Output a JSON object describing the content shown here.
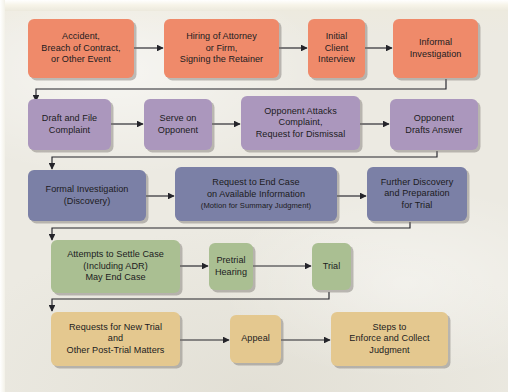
{
  "diagram": {
    "type": "flowchart",
    "background_color": "#eceae2",
    "rows": [
      {
        "id": "event-row",
        "name": "pre-litigation",
        "color": "#ef8a6a",
        "nodes": [
          {
            "id": "accident",
            "label": "Accident,\nBreach of Contract,\nor Other Event"
          },
          {
            "id": "hiring",
            "label": "Hiring of Attorney\nor Firm,\nSigning the Retainer"
          },
          {
            "id": "interview",
            "label": "Initial\nClient\nInterview"
          },
          {
            "id": "informal",
            "label": "Informal\nInvestigation"
          }
        ]
      },
      {
        "id": "pleading-row",
        "name": "pleadings",
        "color": "#ab97bd",
        "nodes": [
          {
            "id": "draft",
            "label": "Draft and File\nComplaint"
          },
          {
            "id": "serve",
            "label": "Serve on\nOpponent"
          },
          {
            "id": "attacks",
            "label": "Opponent Attacks\nComplaint,\nRequest for Dismissal"
          },
          {
            "id": "answer",
            "label": "Opponent\nDrafts Answer"
          }
        ]
      },
      {
        "id": "discovery-row",
        "name": "discovery",
        "color": "#7b80a6",
        "nodes": [
          {
            "id": "formal",
            "label": "Formal Investigation\n(Discovery)"
          },
          {
            "id": "endcase",
            "label": "Request to End Case\non Available Information",
            "sub": "(Motion for Summary Judgment)"
          },
          {
            "id": "further",
            "label": "Further Discovery\nand Preparation\nfor Trial"
          }
        ]
      },
      {
        "id": "settle-row",
        "name": "settlement-and-trial",
        "color": "#aabf92",
        "nodes": [
          {
            "id": "settle",
            "label": "Attempts to Settle Case\n(Including ADR)\nMay End Case"
          },
          {
            "id": "pretrial",
            "label": "Pretrial\nHearing"
          },
          {
            "id": "trial",
            "label": "Trial"
          }
        ]
      },
      {
        "id": "post-row",
        "name": "post-trial",
        "color": "#e4c88f",
        "nodes": [
          {
            "id": "newtrial",
            "label": "Requests for New Trial\nand\nOther Post-Trial Matters"
          },
          {
            "id": "appeal",
            "label": "Appeal"
          },
          {
            "id": "enforce",
            "label": "Steps to\nEnforce and Collect\nJudgment"
          }
        ]
      }
    ],
    "connectors": [
      {
        "from": "accident",
        "to": "hiring",
        "kind": "straight-right"
      },
      {
        "from": "hiring",
        "to": "interview",
        "kind": "straight-right"
      },
      {
        "from": "interview",
        "to": "informal",
        "kind": "straight-right"
      },
      {
        "from": "informal",
        "to": "draft",
        "kind": "wrap-down-left"
      },
      {
        "from": "draft",
        "to": "serve",
        "kind": "straight-right"
      },
      {
        "from": "serve",
        "to": "attacks",
        "kind": "straight-right"
      },
      {
        "from": "attacks",
        "to": "answer",
        "kind": "straight-right"
      },
      {
        "from": "answer",
        "to": "formal",
        "kind": "wrap-down-left"
      },
      {
        "from": "formal",
        "to": "endcase",
        "kind": "straight-right"
      },
      {
        "from": "endcase",
        "to": "further",
        "kind": "straight-right"
      },
      {
        "from": "further",
        "to": "settle",
        "kind": "wrap-down-left"
      },
      {
        "from": "settle",
        "to": "pretrial",
        "kind": "straight-right"
      },
      {
        "from": "pretrial",
        "to": "trial",
        "kind": "straight-right"
      },
      {
        "from": "trial",
        "to": "newtrial",
        "kind": "wrap-down-left"
      },
      {
        "from": "newtrial",
        "to": "appeal",
        "kind": "straight-right"
      },
      {
        "from": "appeal",
        "to": "enforce",
        "kind": "straight-right"
      }
    ]
  }
}
